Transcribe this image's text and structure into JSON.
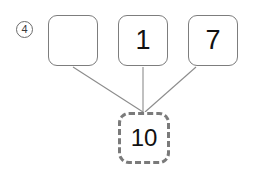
{
  "diagram": {
    "type": "number-bond",
    "problem_number": "4",
    "parts": [
      {
        "value": "",
        "empty": true
      },
      {
        "value": "1",
        "empty": false
      },
      {
        "value": "7",
        "empty": false
      }
    ],
    "whole": {
      "value": "10",
      "border_style": "dashed"
    },
    "colors": {
      "background": "#ffffff",
      "box_border": "#7d7d7d",
      "whole_border": "#7a7a7a",
      "connector_line": "#8c8c8c",
      "text": "#111111",
      "problem_number_text": "#3a3a3a"
    },
    "connectors": [
      {
        "from": "part-box-0",
        "to": "whole-box"
      },
      {
        "from": "part-box-1",
        "to": "whole-box"
      },
      {
        "from": "part-box-2",
        "to": "whole-box"
      }
    ]
  }
}
